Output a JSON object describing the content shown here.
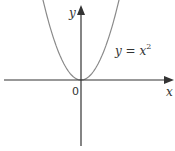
{
  "chart_data": {
    "type": "line",
    "title": "",
    "xlabel": "x",
    "ylabel": "y",
    "origin_label": "0",
    "series": [
      {
        "name": "y = x^2",
        "label": "y = x",
        "label_exp": "2",
        "function": "x^2",
        "color": "#8a8a8a"
      }
    ],
    "axis_color": "#333333",
    "grid": false,
    "legend": "inline annotation right of curve",
    "xlim": [
      -2.3,
      2.8
    ],
    "ylim": [
      -2.0,
      2.4
    ]
  }
}
